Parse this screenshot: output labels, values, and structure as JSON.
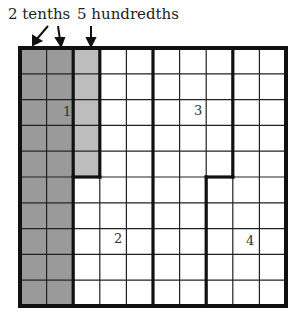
{
  "labels": {
    "tenths": "2 tenths",
    "hundredths": "5 hundredths"
  },
  "grid": {
    "rows": 10,
    "cols": 10,
    "origin": [
      20,
      48
    ],
    "size": [
      266,
      258
    ],
    "colors": {
      "dark_shade": "#9a9a9a",
      "light_shade": "#bdbdbd",
      "background": "#ffffff",
      "thin_line": "#222222",
      "thick_line": "#111111"
    },
    "shaded_tenths_columns": [
      0,
      1
    ],
    "shaded_hundredths": {
      "column": 2,
      "rows": [
        0,
        1,
        2,
        3,
        4
      ]
    }
  },
  "regions": [
    {
      "id": "1",
      "label": "1"
    },
    {
      "id": "2",
      "label": "2"
    },
    {
      "id": "3",
      "label": "3"
    },
    {
      "id": "4",
      "label": "4"
    }
  ]
}
